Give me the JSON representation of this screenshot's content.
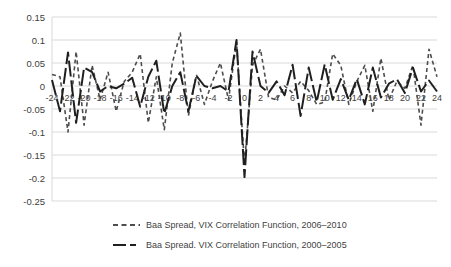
{
  "chart_data": {
    "type": "line",
    "title": "",
    "xlabel": "",
    "ylabel": "",
    "x": [
      -24,
      -23,
      -22,
      -21,
      -20,
      -19,
      -18,
      -17,
      -16,
      -15,
      -14,
      -13,
      -12,
      -11,
      -10,
      -9,
      -8,
      -7,
      -6,
      -5,
      -4,
      -3,
      -2,
      -1,
      0,
      1,
      2,
      3,
      4,
      5,
      6,
      7,
      8,
      9,
      10,
      11,
      12,
      13,
      14,
      15,
      16,
      17,
      18,
      19,
      20,
      21,
      22,
      23,
      24
    ],
    "x_tick_step": 2,
    "ylim": [
      -0.25,
      0.15
    ],
    "y_ticks": [
      "0.15",
      "0.1",
      "0.05",
      "0",
      "-0.05",
      "-0.1",
      "-0.15",
      "-0.2",
      "-0.25"
    ],
    "grid": true,
    "gridline_color": "#d9d9d9",
    "axis_label_color": "#404040",
    "legend_position": "bottom",
    "series": [
      {
        "name": "Baa Spread, VIX Correlation Function, 2006–2010",
        "style": "dashed",
        "color": "#4d4d4d",
        "width": 1.6,
        "values": [
          0.025,
          0.02,
          -0.1,
          0.075,
          -0.085,
          0.045,
          -0.03,
          0.03,
          -0.055,
          0.01,
          0.03,
          0.07,
          -0.08,
          0.02,
          -0.095,
          0.05,
          0.115,
          -0.065,
          0.025,
          -0.04,
          0.01,
          0.05,
          -0.03,
          0.095,
          -0.17,
          0.045,
          0.08,
          -0.025,
          -0.03,
          0,
          -0.015,
          0.01,
          -0.01,
          -0.04,
          -0.035,
          0.07,
          0.045,
          -0.04,
          0.01,
          0.045,
          -0.055,
          0.06,
          -0.03,
          0.01,
          -0.005,
          0.045,
          -0.085,
          0.08,
          0.02
        ]
      },
      {
        "name": "Baa Spread. VIX Correlation Function, 2000–2005",
        "style": "long-dash",
        "color": "#1f1f1f",
        "width": 2,
        "values": [
          0.013,
          -0.055,
          0.073,
          -0.08,
          0.04,
          0.03,
          -0.012,
          0,
          -0.005,
          0.005,
          0.018,
          -0.045,
          0.02,
          0.055,
          -0.06,
          0,
          0.03,
          -0.055,
          0.022,
          0,
          -0.005,
          0,
          -0.012,
          0.1,
          -0.198,
          0.075,
          0,
          -0.015,
          0.01,
          -0.02,
          0.046,
          -0.065,
          0.04,
          -0.035,
          0.047,
          -0.03,
          0.015,
          -0.03,
          0.015,
          -0.04,
          0.04,
          -0.025,
          0.005,
          0.015,
          -0.015,
          0.04,
          -0.012,
          0.012,
          -0.012
        ]
      }
    ]
  }
}
